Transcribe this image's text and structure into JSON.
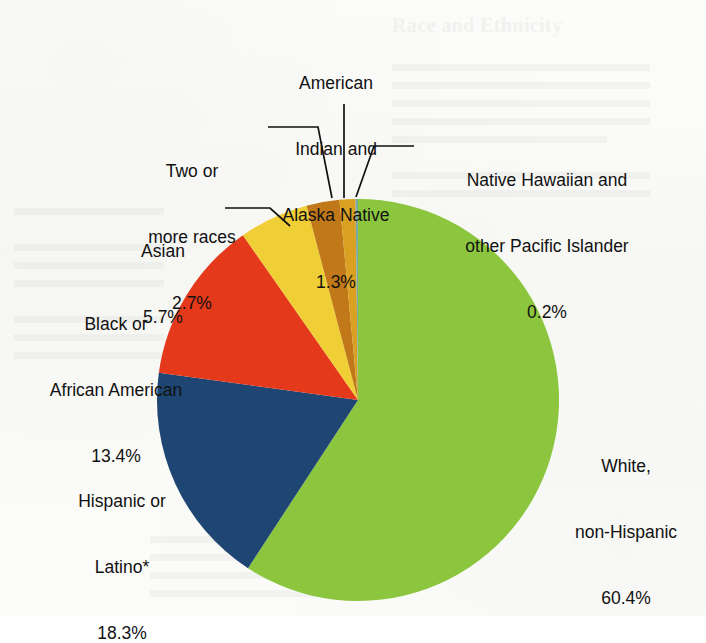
{
  "figure": {
    "background_color": "#fbfbf9",
    "text_color": "#111111",
    "leader_line_color": "#111111"
  },
  "bleed_through": {
    "heading": "Race and Ethnicity"
  },
  "chart_data": {
    "type": "pie",
    "title": "",
    "subtitle": "",
    "xlabel": "",
    "ylabel": "",
    "legend_position": "none",
    "grid": false,
    "units": "percent",
    "total": 100.0,
    "start_angle_deg": 0,
    "direction": "clockwise",
    "categories": [
      "White, non-Hispanic",
      "Hispanic or Latino*",
      "Black or African American",
      "Asian",
      "Two or more races",
      "American Indian and Alaska Native",
      "Native Hawaiian and other Pacific Islander"
    ],
    "values": [
      60.4,
      18.3,
      13.4,
      5.7,
      2.7,
      1.3,
      0.2
    ],
    "colors": [
      "#8CC63E",
      "#1F4673",
      "#E4391B",
      "#F0CE35",
      "#C07818",
      "#D9A021",
      "#79A9A6"
    ],
    "slices": [
      {
        "name": "White, non-Hispanic",
        "label_line1": "White,",
        "label_line2": "non-Hispanic",
        "value_text": "60.4%",
        "value": 60.4,
        "color": "#8CC63E"
      },
      {
        "name": "Hispanic or Latino*",
        "label_line1": "Hispanic or",
        "label_line2": "Latino*",
        "value_text": "18.3%",
        "value": 18.3,
        "color": "#1F4673"
      },
      {
        "name": "Black or African American",
        "label_line1": "Black or",
        "label_line2": "African American",
        "value_text": "13.4%",
        "value": 13.4,
        "color": "#E4391B"
      },
      {
        "name": "Asian",
        "label_line1": "Asian",
        "label_line2": "",
        "value_text": "5.7%",
        "value": 5.7,
        "color": "#F0CE35"
      },
      {
        "name": "Two or more races",
        "label_line1": "Two or",
        "label_line2": "more races",
        "value_text": "2.7%",
        "value": 2.7,
        "color": "#C07818"
      },
      {
        "name": "American Indian and Alaska Native",
        "label_line1": "American",
        "label_line2": "Indian and",
        "label_line3": "Alaska Native",
        "value_text": "1.3%",
        "value": 1.3,
        "color": "#D9A021"
      },
      {
        "name": "Native Hawaiian and other Pacific Islander",
        "label_line1": "Native Hawaiian and",
        "label_line2": "other Pacific Islander",
        "value_text": "0.2%",
        "value": 0.2,
        "color": "#79A9A6"
      }
    ]
  }
}
